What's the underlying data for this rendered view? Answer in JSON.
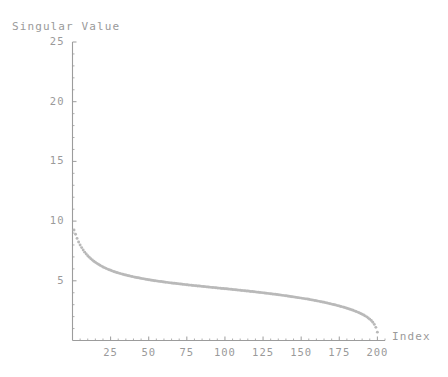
{
  "chart_data": {
    "type": "scatter",
    "title": "",
    "ylabel": "Singular Value",
    "xlabel": "Index",
    "xlim": [
      0,
      205
    ],
    "ylim": [
      0,
      25
    ],
    "grid": false,
    "legend": "none",
    "marker_color": "#b9b9b9",
    "axis_color": "#9c9c9c",
    "text_color": "#9a9a9a",
    "xticks": [
      25,
      50,
      75,
      100,
      125,
      150,
      175,
      200
    ],
    "xtick_labels": [
      "25",
      "50",
      "75",
      "100",
      "125",
      "150",
      "175",
      "200"
    ],
    "yticks": [
      5,
      10,
      15,
      20,
      25
    ],
    "ytick_labels": [
      "5",
      "10",
      "15",
      "20",
      "25"
    ],
    "x": [
      1,
      2,
      3,
      4,
      5,
      6,
      7,
      8,
      9,
      10,
      11,
      12,
      13,
      14,
      15,
      16,
      17,
      18,
      19,
      20,
      21,
      22,
      23,
      24,
      25,
      26,
      27,
      28,
      29,
      30,
      31,
      32,
      33,
      34,
      35,
      36,
      37,
      38,
      39,
      40,
      41,
      42,
      43,
      44,
      45,
      46,
      47,
      48,
      49,
      50,
      51,
      52,
      53,
      54,
      55,
      56,
      57,
      58,
      59,
      60,
      61,
      62,
      63,
      64,
      65,
      66,
      67,
      68,
      69,
      70,
      71,
      72,
      73,
      74,
      75,
      76,
      77,
      78,
      79,
      80,
      81,
      82,
      83,
      84,
      85,
      86,
      87,
      88,
      89,
      90,
      91,
      92,
      93,
      94,
      95,
      96,
      97,
      98,
      99,
      100,
      101,
      102,
      103,
      104,
      105,
      106,
      107,
      108,
      109,
      110,
      111,
      112,
      113,
      114,
      115,
      116,
      117,
      118,
      119,
      120,
      121,
      122,
      123,
      124,
      125,
      126,
      127,
      128,
      129,
      130,
      131,
      132,
      133,
      134,
      135,
      136,
      137,
      138,
      139,
      140,
      141,
      142,
      143,
      144,
      145,
      146,
      147,
      148,
      149,
      150,
      151,
      152,
      153,
      154,
      155,
      156,
      157,
      158,
      159,
      160,
      161,
      162,
      163,
      164,
      165,
      166,
      167,
      168,
      169,
      170,
      171,
      172,
      173,
      174,
      175,
      176,
      177,
      178,
      179,
      180,
      181,
      182,
      183,
      184,
      185,
      186,
      187,
      188,
      189,
      190,
      191,
      192,
      193,
      194,
      195,
      196,
      197,
      198,
      199,
      200
    ],
    "y": [
      9.25,
      8.9,
      8.55,
      8.25,
      8.0,
      7.78,
      7.58,
      7.4,
      7.24,
      7.1,
      6.97,
      6.85,
      6.74,
      6.64,
      6.55,
      6.46,
      6.38,
      6.3,
      6.23,
      6.16,
      6.1,
      6.04,
      5.98,
      5.93,
      5.88,
      5.83,
      5.78,
      5.74,
      5.7,
      5.66,
      5.62,
      5.58,
      5.55,
      5.51,
      5.48,
      5.45,
      5.42,
      5.39,
      5.36,
      5.33,
      5.3,
      5.28,
      5.25,
      5.23,
      5.2,
      5.18,
      5.16,
      5.13,
      5.11,
      5.09,
      5.07,
      5.05,
      5.03,
      5.01,
      4.99,
      4.97,
      4.95,
      4.94,
      4.92,
      4.9,
      4.88,
      4.87,
      4.85,
      4.83,
      4.82,
      4.8,
      4.79,
      4.77,
      4.76,
      4.74,
      4.73,
      4.71,
      4.7,
      4.68,
      4.67,
      4.65,
      4.64,
      4.63,
      4.61,
      4.6,
      4.59,
      4.57,
      4.56,
      4.55,
      4.53,
      4.52,
      4.51,
      4.49,
      4.48,
      4.47,
      4.45,
      4.44,
      4.43,
      4.42,
      4.4,
      4.39,
      4.38,
      4.36,
      4.35,
      4.34,
      4.33,
      4.31,
      4.3,
      4.29,
      4.27,
      4.26,
      4.25,
      4.23,
      4.22,
      4.21,
      4.19,
      4.18,
      4.17,
      4.15,
      4.14,
      4.12,
      4.11,
      4.1,
      4.08,
      4.07,
      4.05,
      4.04,
      4.02,
      4.01,
      3.99,
      3.98,
      3.96,
      3.95,
      3.93,
      3.91,
      3.9,
      3.88,
      3.87,
      3.85,
      3.83,
      3.82,
      3.8,
      3.78,
      3.76,
      3.75,
      3.73,
      3.71,
      3.69,
      3.67,
      3.65,
      3.63,
      3.61,
      3.59,
      3.57,
      3.55,
      3.53,
      3.51,
      3.49,
      3.47,
      3.45,
      3.42,
      3.4,
      3.38,
      3.35,
      3.33,
      3.3,
      3.28,
      3.25,
      3.22,
      3.2,
      3.17,
      3.14,
      3.11,
      3.08,
      3.05,
      3.02,
      2.99,
      2.96,
      2.92,
      2.89,
      2.85,
      2.82,
      2.78,
      2.74,
      2.7,
      2.66,
      2.62,
      2.57,
      2.53,
      2.48,
      2.43,
      2.38,
      2.32,
      2.26,
      2.2,
      2.13,
      2.06,
      1.98,
      1.89,
      1.79,
      1.67,
      1.53,
      1.35,
      1.1,
      0.7
    ]
  },
  "labels": {
    "y_axis_title": "Singular Value",
    "x_axis_title": "Index"
  }
}
